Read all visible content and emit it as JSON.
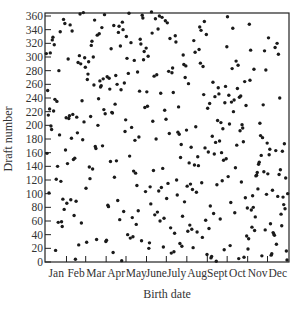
{
  "chart_data": {
    "type": "scatter",
    "title": "",
    "xlabel": "Birth date",
    "ylabel": "Draft number",
    "xlim": [
      1,
      366
    ],
    "ylim": [
      0,
      360
    ],
    "grid": false,
    "legend": null,
    "x_tick_labels": [
      "Jan",
      "Feb",
      "Mar",
      "Apr",
      "May",
      "June",
      "July",
      "Aug",
      "Sept",
      "Oct",
      "Nov",
      "Dec"
    ],
    "y_ticks": [
      0,
      20,
      40,
      60,
      80,
      100,
      120,
      140,
      160,
      180,
      200,
      220,
      240,
      260,
      280,
      300,
      320,
      340,
      360
    ],
    "month_lengths": [
      31,
      29,
      31,
      30,
      31,
      30,
      31,
      31,
      30,
      31,
      30,
      31
    ],
    "x_description": "Day of year (1–366)",
    "values": [
      305,
      159,
      251,
      215,
      101,
      224,
      306,
      199,
      194,
      325,
      329,
      221,
      318,
      238,
      17,
      121,
      235,
      140,
      58,
      280,
      186,
      337,
      118,
      59,
      52,
      92,
      355,
      77,
      349,
      164,
      211,
      86,
      144,
      297,
      210,
      214,
      347,
      91,
      181,
      338,
      216,
      150,
      68,
      152,
      4,
      89,
      212,
      189,
      292,
      25,
      302,
      363,
      290,
      57,
      236,
      179,
      365,
      205,
      299,
      285,
      108,
      29,
      267,
      275,
      293,
      139,
      122,
      213,
      317,
      323,
      136,
      300,
      259,
      354,
      169,
      166,
      33,
      332,
      200,
      239,
      334,
      265,
      256,
      258,
      343,
      170,
      268,
      223,
      362,
      217,
      30,
      32,
      271,
      83,
      81,
      269,
      253,
      147,
      312,
      219,
      218,
      14,
      346,
      124,
      231,
      273,
      148,
      260,
      90,
      336,
      345,
      62,
      316,
      252,
      2,
      351,
      340,
      74,
      262,
      191,
      208,
      330,
      298,
      40,
      276,
      364,
      155,
      35,
      321,
      197,
      65,
      37,
      133,
      295,
      178,
      130,
      55,
      112,
      278,
      75,
      183,
      250,
      326,
      319,
      31,
      361,
      357,
      296,
      308,
      226,
      103,
      313,
      249,
      228,
      301,
      20,
      28,
      110,
      85,
      366,
      335,
      206,
      134,
      272,
      69,
      356,
      180,
      274,
      73,
      341,
      104,
      360,
      60,
      247,
      109,
      358,
      137,
      22,
      64,
      222,
      353,
      209,
      93,
      350,
      115,
      279,
      188,
      327,
      50,
      13,
      277,
      284,
      248,
      15,
      42,
      331,
      322,
      120,
      98,
      190,
      227,
      187,
      27,
      153,
      172,
      23,
      67,
      303,
      289,
      88,
      270,
      287,
      193,
      111,
      45,
      261,
      145,
      54,
      114,
      168,
      48,
      106,
      21,
      324,
      142,
      307,
      198,
      102,
      44,
      154,
      141,
      311,
      344,
      291,
      339,
      116,
      36,
      286,
      245,
      352,
      167,
      61,
      333,
      11,
      225,
      161,
      49,
      232,
      82,
      6,
      8,
      184,
      263,
      71,
      158,
      242,
      175,
      1,
      113,
      207,
      255,
      246,
      177,
      63,
      204,
      160,
      119,
      195,
      149,
      18,
      233,
      257,
      151,
      315,
      359,
      125,
      244,
      202,
      24,
      87,
      234,
      283,
      342,
      220,
      237,
      72,
      138,
      294,
      171,
      254,
      288,
      5,
      241,
      192,
      243,
      117,
      201,
      196,
      176,
      7,
      264,
      94,
      229,
      38,
      79,
      19,
      34,
      348,
      266,
      310,
      76,
      51,
      97,
      80,
      282,
      46,
      66,
      126,
      127,
      131,
      107,
      143,
      146,
      203,
      185,
      156,
      9,
      182,
      230,
      132,
      309,
      47,
      281,
      99,
      174,
      129,
      328,
      157,
      165,
      56,
      10,
      12,
      105,
      43,
      41,
      39,
      314,
      163,
      26,
      320,
      96,
      304,
      128,
      240,
      135,
      70,
      53,
      162,
      95,
      84,
      173,
      78,
      123,
      16,
      3,
      100
    ]
  },
  "axes": {
    "xlabel": "Birth date",
    "ylabel": "Draft number",
    "y_tick_labels": [
      "0",
      "20",
      "40",
      "60",
      "80",
      "100",
      "120",
      "140",
      "160",
      "180",
      "200",
      "220",
      "240",
      "260",
      "280",
      "300",
      "320",
      "340",
      "360"
    ],
    "x_tick_labels": [
      "Jan",
      "Feb",
      "Mar",
      "Apr",
      "May",
      "June",
      "July",
      "Aug",
      "Sept",
      "Oct",
      "Nov",
      "Dec"
    ]
  },
  "style": {
    "point_color": "#1a1a1a",
    "axis_color": "#222222",
    "label_color": "#333333"
  }
}
